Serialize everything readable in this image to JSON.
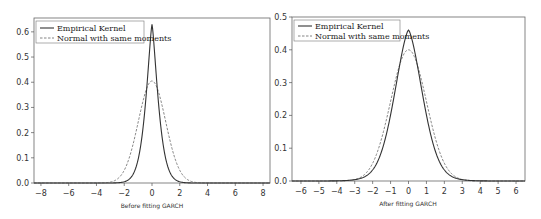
{
  "chart_data": [
    {
      "type": "line",
      "title": "",
      "xlabel": "Before fitting GARCH",
      "ylabel": "",
      "xlim": [
        -8.5,
        8.5
      ],
      "ylim": [
        0,
        0.65
      ],
      "xticks": [
        -8,
        -6,
        -4,
        -2,
        0,
        2,
        4,
        6,
        8
      ],
      "yticks": [
        0.0,
        0.1,
        0.2,
        0.3,
        0.4,
        0.5,
        0.6
      ],
      "grid": false,
      "legend_position": "upper left",
      "series": [
        {
          "name": "Empirical Kernel",
          "style": "solid",
          "peak": {
            "x": 0.0,
            "y": 0.63
          },
          "x": [
            -8,
            -6,
            -4,
            -3,
            -2,
            -1.5,
            -1,
            -0.5,
            0,
            0.5,
            1,
            1.5,
            2,
            3,
            4,
            6,
            8
          ],
          "y": [
            0.0,
            0.001,
            0.005,
            0.012,
            0.04,
            0.09,
            0.2,
            0.42,
            0.63,
            0.42,
            0.2,
            0.09,
            0.04,
            0.012,
            0.005,
            0.001,
            0.0
          ]
        },
        {
          "name": "Normal with same moments",
          "style": "dashed",
          "peak": {
            "x": 0.0,
            "y": 0.405
          },
          "x": [
            -8,
            -4,
            -3,
            -2.5,
            -2,
            -1.5,
            -1,
            -0.5,
            0,
            0.5,
            1,
            1.5,
            2,
            2.5,
            3,
            4,
            8
          ],
          "y": [
            0.0,
            0.0,
            0.003,
            0.02,
            0.06,
            0.13,
            0.24,
            0.35,
            0.405,
            0.35,
            0.24,
            0.13,
            0.06,
            0.02,
            0.003,
            0.0,
            0.0
          ]
        }
      ]
    },
    {
      "type": "line",
      "title": "",
      "xlabel": "After fitting GARCH",
      "ylabel": "",
      "xlim": [
        -6.5,
        6.5
      ],
      "ylim": [
        0,
        0.5
      ],
      "xticks": [
        -6,
        -5,
        -4,
        -3,
        -2,
        -1,
        0,
        1,
        2,
        3,
        4,
        5,
        6
      ],
      "yticks": [
        0.0,
        0.1,
        0.2,
        0.3,
        0.4,
        0.5
      ],
      "grid": false,
      "legend_position": "upper left",
      "series": [
        {
          "name": "Empirical Kernel",
          "style": "solid",
          "peak": {
            "x": 0.0,
            "y": 0.46
          },
          "x": [
            -6,
            -4,
            -3,
            -2.5,
            -2,
            -1.5,
            -1,
            -0.5,
            0,
            0.5,
            1,
            1.5,
            2,
            2.5,
            3,
            4,
            6
          ],
          "y": [
            0.0,
            0.002,
            0.01,
            0.025,
            0.06,
            0.13,
            0.25,
            0.39,
            0.46,
            0.39,
            0.25,
            0.13,
            0.06,
            0.025,
            0.01,
            0.002,
            0.0
          ]
        },
        {
          "name": "Normal with same moments",
          "style": "dashed",
          "peak": {
            "x": 0.0,
            "y": 0.4
          },
          "x": [
            -6,
            -4,
            -3,
            -2.5,
            -2,
            -1.5,
            -1,
            -0.5,
            0,
            0.5,
            1,
            1.5,
            2,
            2.5,
            3,
            4,
            6
          ],
          "y": [
            0.0,
            0.0,
            0.004,
            0.018,
            0.054,
            0.13,
            0.242,
            0.352,
            0.399,
            0.352,
            0.242,
            0.13,
            0.054,
            0.018,
            0.004,
            0.0,
            0.0
          ]
        }
      ]
    }
  ],
  "left_chart": {
    "xlabel": "Before fitting GARCH",
    "legend": [
      "Empirical Kernel",
      "Normal with same moments"
    ],
    "yticks": [
      "0.0",
      "0.1",
      "0.2",
      "0.3",
      "0.4",
      "0.5",
      "0.6"
    ],
    "xticks": [
      "−8",
      "−6",
      "−4",
      "−2",
      "0",
      "2",
      "4",
      "6",
      "8"
    ]
  },
  "right_chart": {
    "xlabel": "After fitting GARCH",
    "legend": [
      "Empirical Kernel",
      "Normal with same moments"
    ],
    "yticks": [
      "0.0",
      "0.1",
      "0.2",
      "0.3",
      "0.4",
      "0.5"
    ],
    "xticks": [
      "−6",
      "−5",
      "−4",
      "−3",
      "−2",
      "−1",
      "0",
      "1",
      "2",
      "3",
      "4",
      "5",
      "6"
    ]
  },
  "colors": {
    "line": "#333333",
    "dashed": "#777777",
    "axis": "#555555"
  }
}
